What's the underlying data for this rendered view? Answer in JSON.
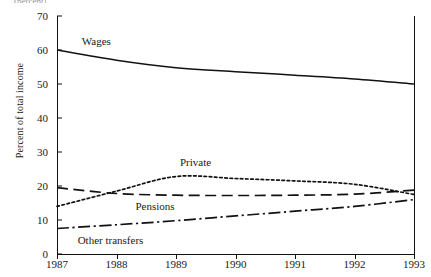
{
  "chart_data": {
    "type": "line",
    "title": "",
    "xlabel": "",
    "ylabel": "Percent of total income",
    "x": [
      1987,
      1988,
      1989,
      1990,
      1991,
      1992,
      1993
    ],
    "xtick_labels": [
      "1987",
      "1988",
      "1989",
      "1990",
      "1991",
      "1992",
      "1993"
    ],
    "ytick_labels": [
      "0",
      "10",
      "20",
      "30",
      "40",
      "50",
      "60",
      "70"
    ],
    "yticks": [
      0,
      10,
      20,
      30,
      40,
      50,
      60,
      70
    ],
    "ylim": [
      0,
      70
    ],
    "xlim": [
      1987,
      1993
    ],
    "grid": false,
    "legend_position": "inline-labels",
    "series": [
      {
        "name": "Wages",
        "style": "solid",
        "color": "#111111",
        "values": [
          60.0,
          57.0,
          54.8,
          53.6,
          52.6,
          51.5,
          50.0
        ]
      },
      {
        "name": "Private",
        "style": "dotted",
        "color": "#111111",
        "values": [
          14.0,
          18.5,
          22.8,
          22.2,
          21.5,
          20.5,
          17.5
        ]
      },
      {
        "name": "Pensions",
        "style": "dashed",
        "color": "#111111",
        "values": [
          19.5,
          17.8,
          17.3,
          17.2,
          17.3,
          17.6,
          18.8
        ]
      },
      {
        "name": "Other transfers",
        "style": "dash-dot",
        "color": "#111111",
        "values": [
          7.5,
          8.6,
          9.8,
          11.2,
          12.6,
          14.0,
          16.0
        ]
      }
    ],
    "annotations": [
      {
        "text": "Wages",
        "series": "Wages"
      },
      {
        "text": "Private",
        "series": "Private"
      },
      {
        "text": "Pensions",
        "series": "Pensions"
      },
      {
        "text": "Other transfers",
        "series": "Other transfers"
      }
    ]
  }
}
